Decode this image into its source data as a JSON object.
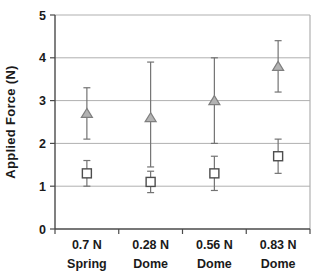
{
  "chart_data": {
    "type": "scatter",
    "title": "",
    "xlabel": "",
    "ylabel": "Applied Force (N)",
    "ylim": [
      0,
      5
    ],
    "yticks": [
      0,
      1,
      2,
      3,
      4,
      5
    ],
    "grid": "horizontal",
    "legend": "none",
    "categories": [
      {
        "line1": "0.7 N",
        "line2": "Spring"
      },
      {
        "line1": "0.28 N",
        "line2": "Dome"
      },
      {
        "line1": "0.56 N",
        "line2": "Dome"
      },
      {
        "line1": "0.83 N",
        "line2": "Dome"
      }
    ],
    "series": [
      {
        "name": "triangle-series",
        "marker": "triangle",
        "values": [
          2.7,
          2.6,
          3.0,
          3.8
        ],
        "err_minus": [
          0.6,
          1.15,
          1.0,
          0.6
        ],
        "err_plus": [
          0.6,
          1.3,
          1.0,
          0.6
        ],
        "marker_fill": "#b3b3b3",
        "marker_stroke": "#7f7f7f"
      },
      {
        "name": "square-series",
        "marker": "square",
        "values": [
          1.3,
          1.1,
          1.3,
          1.7
        ],
        "err_minus": [
          0.3,
          0.25,
          0.4,
          0.4
        ],
        "err_plus": [
          0.3,
          0.25,
          0.4,
          0.4
        ],
        "marker_fill": "#ffffff",
        "marker_stroke": "#4d4d4d"
      }
    ],
    "colors": {
      "background": "#ffffff",
      "gridline": "#b0b0b0",
      "plot_border": "#b0b0b0",
      "axis": "#4a4a4a",
      "error_bar": "#737373",
      "text": "#1a1a1a"
    }
  }
}
